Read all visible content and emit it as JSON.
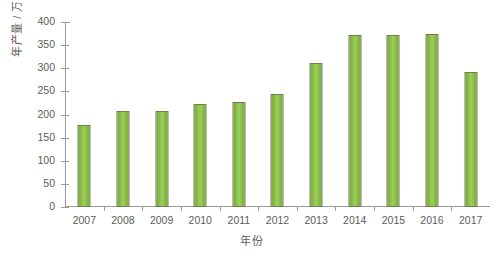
{
  "chart_data": {
    "type": "bar",
    "title": "",
    "xlabel": "年份",
    "ylabel": "年产量 / 万 t",
    "categories": [
      "2007",
      "2008",
      "2009",
      "2010",
      "2011",
      "2012",
      "2013",
      "2014",
      "2015",
      "2016",
      "2017"
    ],
    "values": [
      177,
      208,
      208,
      223,
      228,
      244,
      311,
      371,
      371,
      375,
      292
    ],
    "series": [
      {
        "name": "年产量",
        "values": [
          177,
          208,
          208,
          223,
          228,
          244,
          311,
          371,
          371,
          375,
          292
        ]
      }
    ],
    "ylim": [
      0,
      400
    ],
    "ytick_step": 50,
    "yticks": [
      "0",
      "50",
      "100",
      "150",
      "200",
      "250",
      "300",
      "350",
      "400"
    ],
    "grid": false,
    "legend": "none",
    "bar_color": "#8cc04a",
    "bar_border_color": "#6f7f52",
    "axis_color": "#9a9a9a",
    "text_color": "#5c5c5c",
    "background_color": "#ffffff"
  },
  "axes": {
    "y_title": "年产量 / 万 t",
    "x_title": "年份"
  }
}
